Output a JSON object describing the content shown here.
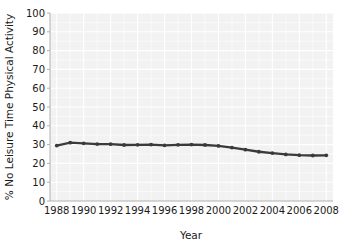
{
  "chart_data": {
    "type": "line",
    "title": "",
    "xlabel": "Year",
    "ylabel": "% No Leisure Time Physical Activity",
    "xlim": [
      1987.5,
      2008.5
    ],
    "ylim": [
      0,
      100
    ],
    "grid": true,
    "legend": "none",
    "x_tick_labels": [
      "1988",
      "1990",
      "1992",
      "1994",
      "1996",
      "1998",
      "2000",
      "2002",
      "2004",
      "2006",
      "2008"
    ],
    "y_tick_labels": [
      "0",
      "10",
      "20",
      "30",
      "40",
      "50",
      "60",
      "70",
      "80",
      "90",
      "100"
    ],
    "x": [
      1988,
      1989,
      1990,
      1991,
      1992,
      1993,
      1994,
      1995,
      1996,
      1997,
      1998,
      1999,
      2000,
      2001,
      2002,
      2003,
      2004,
      2005,
      2006,
      2007,
      2008
    ],
    "series": [
      {
        "name": "% No Leisure Time Physical Activity",
        "color": "#3a3a3a",
        "values": [
          29.5,
          31.0,
          30.7,
          30.3,
          30.2,
          29.8,
          29.9,
          30.0,
          29.6,
          29.9,
          30.0,
          29.8,
          29.3,
          28.4,
          27.3,
          26.2,
          25.5,
          24.8,
          24.4,
          24.2,
          24.3
        ]
      }
    ]
  },
  "axes": {
    "y_title": "% No Leisure Time Physical Activity",
    "x_title": "Year"
  },
  "colors": {
    "series": "#3a3a3a",
    "plot_background": "#f2f2f2",
    "gridline": "#ffffff",
    "axis": "#b0b0b0"
  }
}
